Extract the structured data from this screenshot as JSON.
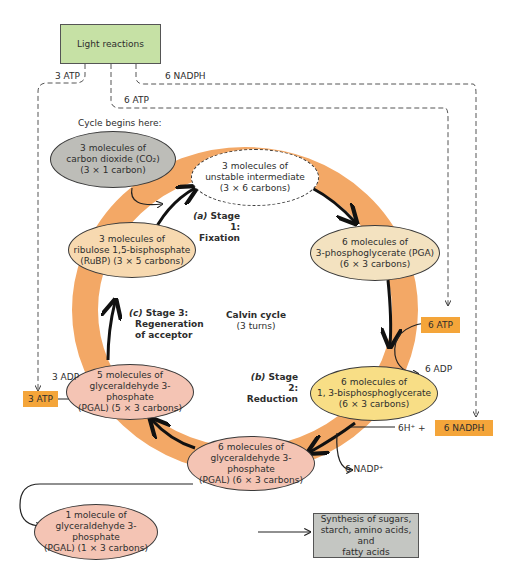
{
  "diagram": {
    "title": "Calvin cycle",
    "subtitle": "(3 turns)",
    "light_reactions": {
      "label": "Light reactions",
      "color": "#c6e1a5"
    },
    "inputs": {
      "atp_3": "3 ATP",
      "atp_6": "6 ATP",
      "nadph_6": "6 NADPH"
    },
    "cycle_begins": "Cycle begins here:",
    "nodes": {
      "co2": {
        "line1": "3 molecules of",
        "line2": "carbon dioxide (CO₂)",
        "line3": "(3 × 1 carbon)",
        "color": "#bdbdb8"
      },
      "unstable": {
        "line1": "3 molecules of",
        "line2": "unstable intermediate",
        "line3": "(3 × 6 carbons)",
        "color": "#ffffff"
      },
      "pga": {
        "line1": "6 molecules of",
        "line2": "3-phosphoglycerate (PGA)",
        "line3": "(6 × 3 carbons)",
        "color": "#f3e2c0"
      },
      "bpg": {
        "line1": "6 molecules of",
        "line2": "1, 3-bisphosphoglycerate",
        "line3": "(6 × 3 carbons)",
        "color": "#f8de86"
      },
      "pgal6": {
        "line1": "6 molecules of",
        "line2": "glyceraldehyde 3-phosphate",
        "line3": "(PGAL) (6 × 3 carbons)",
        "color": "#f4c4b4"
      },
      "pgal5": {
        "line1": "5 molecules of",
        "line2": "glyceraldehyde 3-phosphate",
        "line3": "(PGAL) (5 × 3 carbons)",
        "color": "#f4c4b4"
      },
      "rubp": {
        "line1": "3 molecules of",
        "line2": "ribulose 1,5-bisphosphate",
        "line3": "(RuBP) (3 × 5 carbons)",
        "color": "#f7d9b0"
      },
      "pgal1": {
        "line1": "1 molecule of",
        "line2": "glyceraldehyde 3-phosphate",
        "line3": "(PGAL) (1 × 3 carbons)",
        "color": "#f4c4b4"
      },
      "synthesis": {
        "line1": "Synthesis of sugars,",
        "line2": "starch, amino acids, and",
        "line3": "fatty acids",
        "color": "#c4c6c2"
      }
    },
    "stages": {
      "s1": {
        "prefix": "(a)",
        "name": "Stage 1:",
        "desc": "Fixation"
      },
      "s2": {
        "prefix": "(b)",
        "name": "Stage 2:",
        "desc": "Reduction"
      },
      "s3": {
        "prefix": "(c)",
        "name": "Stage 3:",
        "desc1": "Regeneration",
        "desc2": "of acceptor"
      }
    },
    "tags": {
      "atp6": "6 ATP",
      "atp3": "3 ATP",
      "nadph6": "6 NADPH",
      "color": "#f4a53a"
    },
    "byproducts": {
      "adp6": "6 ADP",
      "adp3": "3 ADP",
      "h6": "6H⁺  +",
      "nadp6": "6 NADP⁺"
    },
    "ring_color": "#f3a866"
  }
}
